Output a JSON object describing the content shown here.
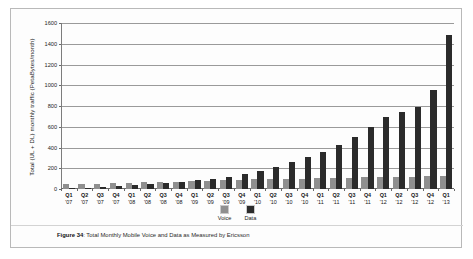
{
  "figure": {
    "caption_prefix": "Figure 34",
    "caption_text": ": Total Monthly Mobile Voice and Data as Measured by Ericsson"
  },
  "legend": {
    "items": [
      {
        "label": "Voice",
        "color": "#8f8f8f"
      },
      {
        "label": "Data",
        "color": "#2b2b2b"
      }
    ]
  },
  "chart_data": {
    "type": "bar",
    "title": "Total Monthly Mobile Voice and Data as Measured by Ericsson",
    "xlabel": "",
    "ylabel": "Total (UL + DL) monthly traffic (PetaBytes/month)",
    "ylim": [
      0,
      1600
    ],
    "yticks": [
      0,
      200,
      400,
      600,
      800,
      1000,
      1200,
      1400,
      1600
    ],
    "grid": true,
    "legend_position": "bottom-center",
    "grouping": "grouped",
    "categories": [
      "Q1 '07",
      "Q2 '07",
      "Q3 '07",
      "Q4 '07",
      "Q1 '08",
      "Q2 '08",
      "Q3 '08",
      "Q4 '08",
      "Q1 '09",
      "Q2 '09",
      "Q3 '09",
      "Q4 '09",
      "Q1 '10",
      "Q2 '10",
      "Q3 '10",
      "Q4 '10",
      "Q1 '11",
      "Q2 '11",
      "Q3 '11",
      "Q4 '11",
      "Q1 '12",
      "Q2 '12",
      "Q3 '12",
      "Q4 '12",
      "Q1 '13"
    ],
    "quarters": [
      "Q1",
      "Q2",
      "Q3",
      "Q4",
      "Q1",
      "Q2",
      "Q3",
      "Q4",
      "Q1",
      "Q2",
      "Q3",
      "Q4",
      "Q1",
      "Q2",
      "Q3",
      "Q4",
      "Q1",
      "Q2",
      "Q3",
      "Q4",
      "Q1",
      "Q2",
      "Q3",
      "Q4",
      "Q1"
    ],
    "years": [
      "'07",
      "'07",
      "'07",
      "'07",
      "'08",
      "'08",
      "'08",
      "'08",
      "'09",
      "'09",
      "'09",
      "'09",
      "'10",
      "'10",
      "'10",
      "'10",
      "'11",
      "'11",
      "'11",
      "'11",
      "'12",
      "'12",
      "'12",
      "'12",
      "'13"
    ],
    "series": [
      {
        "name": "Voice",
        "color": "#8f8f8f",
        "values": [
          45,
          48,
          52,
          55,
          60,
          64,
          68,
          72,
          76,
          80,
          84,
          88,
          92,
          95,
          98,
          100,
          104,
          107,
          110,
          112,
          115,
          118,
          120,
          122,
          125
        ]
      },
      {
        "name": "Data",
        "color": "#2b2b2b",
        "values": [
          8,
          12,
          18,
          25,
          35,
          45,
          58,
          70,
          85,
          100,
          120,
          145,
          175,
          215,
          260,
          310,
          360,
          420,
          500,
          600,
          690,
          740,
          790,
          950,
          1480
        ]
      }
    ]
  }
}
